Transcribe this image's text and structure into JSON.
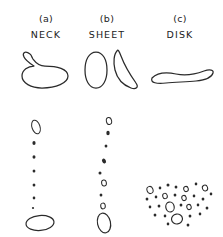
{
  "figure": {
    "title": "",
    "background_color": "#ffffff",
    "ink_color": "#2b2b2b",
    "width": 223,
    "height": 237,
    "columns": [
      {
        "index": "(a)",
        "name": "NECK",
        "center_x": 46
      },
      {
        "index": "(b)",
        "name": "SHEET",
        "center_x": 107
      },
      {
        "index": "(c)",
        "name": "DISK",
        "center_x": 180
      }
    ],
    "panels": {
      "upper": {
        "description": "parent liquid ligament shapes before breakup",
        "y_range": [
          44,
          92
        ]
      },
      "lower": {
        "description": "resulting droplet size distributions after breakup",
        "y_range": [
          110,
          232
        ]
      }
    }
  },
  "chart_data": {
    "type": "scatter",
    "xlabel": "",
    "ylabel": "",
    "grid": false,
    "legend": "none",
    "categories": [
      "NECK",
      "SHEET",
      "DISK"
    ],
    "series": [
      {
        "name": "NECK",
        "label": "(a)",
        "parent_shape": "closed loop with narrow neck at upper left",
        "parent_outline": "M 30 54 C 25 50 22 53 24 57 C 26 61 31 64 34 66 C 28 66 22 70 22 76 C 22 83 31 88 42 88 C 56 88 68 83 68 76 C 68 69 57 66 45 66 C 40 66 36 63 33 59 C 31 56 31 54 30 54 Z",
        "droplets": [
          {
            "cx": 36,
            "cy": 127,
            "rx": 4.0,
            "ry": 7.0,
            "rot": -18,
            "filled": false
          },
          {
            "cx": 34,
            "cy": 143,
            "rx": 1.6,
            "ry": 2.0,
            "rot": 0,
            "filled": true
          },
          {
            "cx": 34,
            "cy": 157,
            "rx": 1.5,
            "ry": 1.7,
            "rot": 0,
            "filled": true
          },
          {
            "cx": 34,
            "cy": 171,
            "rx": 1.4,
            "ry": 1.6,
            "rot": 0,
            "filled": true
          },
          {
            "cx": 34,
            "cy": 185,
            "rx": 1.4,
            "ry": 1.5,
            "rot": 0,
            "filled": true
          },
          {
            "cx": 34,
            "cy": 198,
            "rx": 1.3,
            "ry": 1.4,
            "rot": 0,
            "filled": true
          },
          {
            "cx": 33,
            "cy": 208,
            "rx": 1.1,
            "ry": 1.1,
            "rot": 0,
            "filled": true
          },
          {
            "cx": 40,
            "cy": 223,
            "rx": 14.0,
            "ry": 7.5,
            "rot": -5,
            "filled": false
          }
        ]
      },
      {
        "name": "SHEET",
        "label": "(b)",
        "parent_shape": "rounded blob beside a thin curved sheet",
        "parent_outline_left": "M 96 52 C 89 52 85 60 85 70 C 85 80 89 88 96 88 C 103 88 107 80 107 70 C 107 60 103 52 96 52 Z",
        "parent_outline_right": "M 117 51 C 114 54 113 62 115 70 C 117 78 123 85 131 88 C 136 90 139 87 136 83 C 131 76 124 64 121 56 C 119 51 118 49 117 51 Z",
        "droplets": [
          {
            "cx": 109,
            "cy": 121,
            "rx": 2.6,
            "ry": 3.6,
            "rot": -12,
            "filled": false
          },
          {
            "cx": 108,
            "cy": 133,
            "rx": 1.7,
            "ry": 2.2,
            "rot": 0,
            "filled": true
          },
          {
            "cx": 106,
            "cy": 146,
            "rx": 1.4,
            "ry": 1.5,
            "rot": 0,
            "filled": true
          },
          {
            "cx": 104,
            "cy": 161,
            "rx": 1.9,
            "ry": 2.6,
            "rot": -25,
            "filled": true
          },
          {
            "cx": 100,
            "cy": 173,
            "rx": 1.5,
            "ry": 1.6,
            "rot": 0,
            "filled": true
          },
          {
            "cx": 104,
            "cy": 183,
            "rx": 2.4,
            "ry": 3.0,
            "rot": -10,
            "filled": false
          },
          {
            "cx": 101,
            "cy": 195,
            "rx": 1.4,
            "ry": 1.5,
            "rot": 0,
            "filled": true
          },
          {
            "cx": 103,
            "cy": 206,
            "rx": 2.3,
            "ry": 2.9,
            "rot": -8,
            "filled": false
          },
          {
            "cx": 104,
            "cy": 223,
            "rx": 6.5,
            "ry": 10.0,
            "rot": -12,
            "filled": false
          }
        ]
      },
      {
        "name": "DISK",
        "label": "(c)",
        "parent_shape": "flat wavy horizontal disk seen edge-on",
        "parent_outline": "M 152 78 C 157 73 166 72 176 74 C 186 76 196 74 204 71 C 210 69 214 70 213 73 C 212 77 205 80 196 81 C 186 82 176 82 166 83 C 157 84 150 83 152 78 Z",
        "droplets": [
          {
            "cx": 150,
            "cy": 190,
            "rx": 3.0,
            "ry": 3.6,
            "rot": -20,
            "filled": false
          },
          {
            "cx": 160,
            "cy": 188,
            "rx": 1.3,
            "ry": 1.4,
            "rot": 0,
            "filled": true
          },
          {
            "cx": 168,
            "cy": 185,
            "rx": 1.5,
            "ry": 1.6,
            "rot": 0,
            "filled": true
          },
          {
            "cx": 176,
            "cy": 187,
            "rx": 1.4,
            "ry": 1.5,
            "rot": 0,
            "filled": true
          },
          {
            "cx": 186,
            "cy": 189,
            "rx": 2.3,
            "ry": 2.6,
            "rot": -15,
            "filled": false
          },
          {
            "cx": 196,
            "cy": 184,
            "rx": 1.3,
            "ry": 1.4,
            "rot": 0,
            "filled": true
          },
          {
            "cx": 205,
            "cy": 188,
            "rx": 2.6,
            "ry": 3.0,
            "rot": -20,
            "filled": false
          },
          {
            "cx": 147,
            "cy": 199,
            "rx": 1.4,
            "ry": 1.5,
            "rot": 0,
            "filled": true
          },
          {
            "cx": 156,
            "cy": 197,
            "rx": 1.3,
            "ry": 1.4,
            "rot": 0,
            "filled": true
          },
          {
            "cx": 165,
            "cy": 196,
            "rx": 2.3,
            "ry": 2.7,
            "rot": -15,
            "filled": false
          },
          {
            "cx": 175,
            "cy": 195,
            "rx": 1.4,
            "ry": 1.5,
            "rot": 0,
            "filled": true
          },
          {
            "cx": 184,
            "cy": 198,
            "rx": 2.2,
            "ry": 2.6,
            "rot": -15,
            "filled": false
          },
          {
            "cx": 194,
            "cy": 196,
            "rx": 1.3,
            "ry": 1.4,
            "rot": 0,
            "filled": true
          },
          {
            "cx": 203,
            "cy": 199,
            "rx": 1.4,
            "ry": 1.5,
            "rot": 0,
            "filled": true
          },
          {
            "cx": 211,
            "cy": 194,
            "rx": 1.3,
            "ry": 1.4,
            "rot": 0,
            "filled": true
          },
          {
            "cx": 150,
            "cy": 207,
            "rx": 1.3,
            "ry": 1.4,
            "rot": 0,
            "filled": true
          },
          {
            "cx": 159,
            "cy": 206,
            "rx": 1.4,
            "ry": 1.5,
            "rot": 0,
            "filled": true
          },
          {
            "cx": 170,
            "cy": 207,
            "rx": 4.2,
            "ry": 5.0,
            "rot": -12,
            "filled": false
          },
          {
            "cx": 181,
            "cy": 205,
            "rx": 1.4,
            "ry": 1.5,
            "rot": 0,
            "filled": true
          },
          {
            "cx": 189,
            "cy": 207,
            "rx": 2.2,
            "ry": 2.6,
            "rot": -15,
            "filled": false
          },
          {
            "cx": 198,
            "cy": 205,
            "rx": 1.3,
            "ry": 1.4,
            "rot": 0,
            "filled": true
          },
          {
            "cx": 207,
            "cy": 208,
            "rx": 1.4,
            "ry": 1.5,
            "rot": 0,
            "filled": true
          },
          {
            "cx": 155,
            "cy": 215,
            "rx": 1.4,
            "ry": 1.5,
            "rot": 0,
            "filled": true
          },
          {
            "cx": 165,
            "cy": 216,
            "rx": 1.3,
            "ry": 1.4,
            "rot": 0,
            "filled": true
          },
          {
            "cx": 177,
            "cy": 219,
            "rx": 5.5,
            "ry": 5.0,
            "rot": -8,
            "filled": false
          },
          {
            "cx": 190,
            "cy": 216,
            "rx": 1.4,
            "ry": 1.5,
            "rot": 0,
            "filled": true
          },
          {
            "cx": 200,
            "cy": 214,
            "rx": 1.3,
            "ry": 1.4,
            "rot": 0,
            "filled": true
          },
          {
            "cx": 168,
            "cy": 224,
            "rx": 1.3,
            "ry": 1.4,
            "rot": 0,
            "filled": true
          },
          {
            "cx": 188,
            "cy": 225,
            "rx": 1.4,
            "ry": 1.5,
            "rot": 0,
            "filled": true
          }
        ]
      }
    ]
  }
}
